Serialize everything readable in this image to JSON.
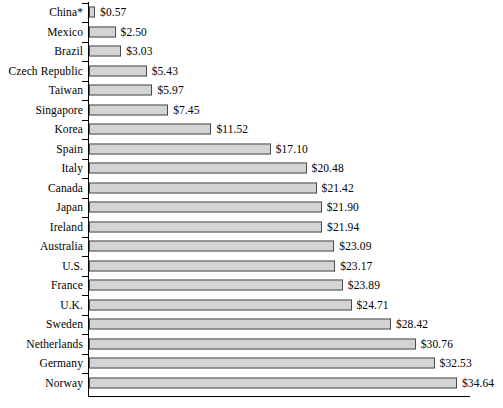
{
  "chart_data": {
    "type": "bar",
    "orientation": "horizontal",
    "title": "",
    "subtitle": "",
    "xlabel": "",
    "ylabel": "",
    "grid": false,
    "legend": false,
    "axis_range": [
      0,
      34.64
    ],
    "value_prefix": "$",
    "categories": [
      "China*",
      "Mexico",
      "Brazil",
      "Czech Republic",
      "Taiwan",
      "Singapore",
      "Korea",
      "Spain",
      "Italy",
      "Canada",
      "Japan",
      "Ireland",
      "Australia",
      "U.S.",
      "France",
      "U.K.",
      "Sweden",
      "Netherlands",
      "Germany",
      "Norway"
    ],
    "values": [
      0.57,
      2.5,
      3.03,
      5.43,
      5.97,
      7.45,
      11.52,
      17.1,
      20.48,
      21.42,
      21.9,
      21.94,
      23.09,
      23.17,
      23.89,
      24.71,
      28.42,
      30.76,
      32.53,
      34.64
    ],
    "value_labels": [
      "$0.57",
      "$2.50",
      "$3.03",
      "$5.43",
      "$5.97",
      "$7.45",
      "$11.52",
      "$17.10",
      "$20.48",
      "$21.42",
      "$21.90",
      "$21.94",
      "$23.09",
      "$23.17",
      "$23.89",
      "$24.71",
      "$28.42",
      "$30.76",
      "$32.53",
      "$34.64"
    ],
    "colors": {
      "bar_fill": "#d4d4d4",
      "bar_border": "#4a4a4a",
      "axis": "#000000",
      "text": "#000000",
      "background": "#ffffff"
    }
  }
}
